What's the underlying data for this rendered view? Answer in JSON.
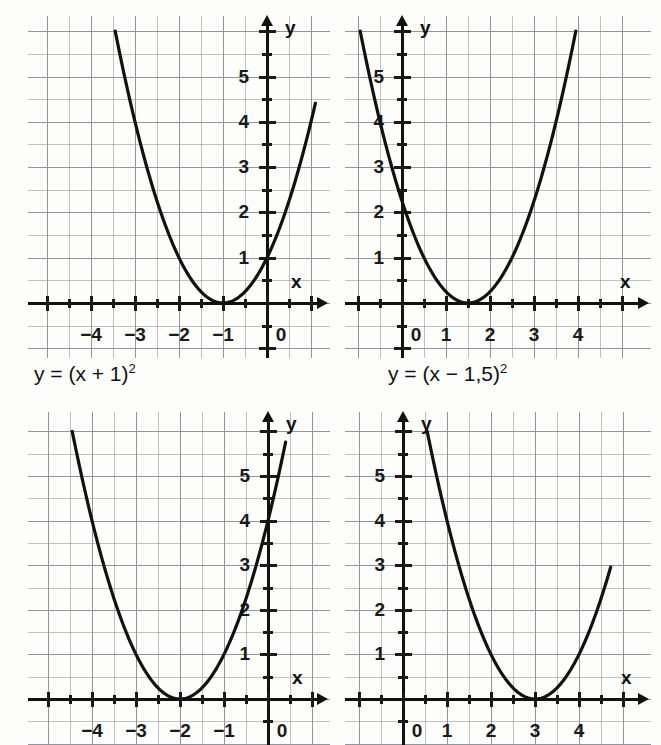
{
  "page": {
    "kind": "worksheet-figure",
    "background": "#fdfdfb",
    "ink": "#111111",
    "grid_color": "#8d8f96",
    "panels": 4
  },
  "chart_data": [
    {
      "id": "panel-1",
      "type": "line",
      "title": "",
      "function_label": "y = (x + 1)²",
      "function_base": "y = (x + 1)",
      "function_exponent": "2",
      "vertex": [
        -1,
        0
      ],
      "formula": "y = (x + 1)^2",
      "xlabel": "x",
      "ylabel": "y",
      "xlim": [
        -5.0,
        0.9
      ],
      "ylim": [
        -0.6,
        6.0
      ],
      "grid": true,
      "grid_step": 0.5,
      "tick_step": 0.5,
      "xticks": [
        -4,
        -3,
        -2,
        -1,
        0
      ],
      "xtick_labels": [
        "−4",
        "−3",
        "−2",
        "−1",
        "0"
      ],
      "yticks": [
        1,
        2,
        3,
        4,
        5
      ],
      "ytick_labels": [
        "1",
        "2",
        "3",
        "4",
        "5"
      ],
      "x": [
        -3.45,
        -3.0,
        -2.5,
        -2.0,
        -1.5,
        -1.0,
        -0.5,
        0.0,
        0.5,
        1.1
      ],
      "y": [
        6.0,
        4.0,
        2.25,
        1.0,
        0.25,
        0.0,
        0.25,
        1.0,
        2.25,
        4.41
      ]
    },
    {
      "id": "panel-2",
      "type": "line",
      "title": "",
      "function_label": "y = (x − 1,5)²",
      "function_base": "y = (x − 1,5)",
      "function_exponent": "2",
      "vertex": [
        1.5,
        0
      ],
      "formula": "y = (x - 1.5)^2",
      "xlabel": "x",
      "ylabel": "y",
      "xlim": [
        -0.75,
        5.1
      ],
      "ylim": [
        -0.6,
        6.0
      ],
      "grid": true,
      "grid_step": 0.5,
      "tick_step": 0.5,
      "xticks": [
        0,
        1,
        2,
        3,
        4
      ],
      "xtick_labels": [
        "0",
        "1",
        "2",
        "3",
        "4"
      ],
      "yticks": [
        1,
        2,
        3,
        4,
        5
      ],
      "ytick_labels": [
        "1",
        "2",
        "3",
        "4",
        "5"
      ],
      "x": [
        -0.95,
        -0.5,
        0.0,
        0.5,
        1.0,
        1.5,
        2.0,
        2.5,
        3.0,
        3.5,
        3.95
      ],
      "y": [
        6.0,
        4.0,
        2.25,
        1.0,
        0.25,
        0.0,
        0.25,
        1.0,
        2.25,
        4.0,
        6.0
      ]
    },
    {
      "id": "panel-3",
      "type": "line",
      "title": "",
      "function_label": "",
      "function_base": "",
      "function_exponent": "",
      "vertex": [
        -2,
        0
      ],
      "formula": "y = (x + 2)^2",
      "xlabel": "x",
      "ylabel": "y",
      "xlim": [
        -5.0,
        0.9
      ],
      "ylim": [
        -0.6,
        6.2
      ],
      "grid": true,
      "grid_step": 0.5,
      "tick_step": 0.5,
      "xticks": [
        -4,
        -3,
        -2,
        -1,
        0
      ],
      "xtick_labels": [
        "−4",
        "−3",
        "−2",
        "−1",
        "0"
      ],
      "yticks": [
        1,
        2,
        3,
        4,
        5
      ],
      "ytick_labels": [
        "1",
        "2",
        "3",
        "4",
        "5"
      ],
      "x": [
        -4.45,
        -4.0,
        -3.5,
        -3.0,
        -2.5,
        -2.0,
        -1.5,
        -1.0,
        -0.5,
        0.0,
        0.4
      ],
      "y": [
        6.0,
        4.0,
        2.25,
        1.0,
        0.25,
        0.0,
        0.25,
        1.0,
        2.25,
        4.0,
        5.76
      ]
    },
    {
      "id": "panel-4",
      "type": "line",
      "title": "",
      "function_label": "",
      "function_base": "",
      "function_exponent": "",
      "vertex": [
        3,
        0
      ],
      "formula": "y = (x - 3)^2",
      "xlabel": "x",
      "ylabel": "y",
      "xlim": [
        -0.75,
        5.1
      ],
      "ylim": [
        -0.6,
        6.2
      ],
      "grid": true,
      "grid_step": 0.5,
      "tick_step": 0.5,
      "xticks": [
        0,
        1,
        2,
        3,
        4
      ],
      "xtick_labels": [
        "0",
        "1",
        "2",
        "3",
        "4"
      ],
      "yticks": [
        1,
        2,
        3,
        4,
        5
      ],
      "ytick_labels": [
        "1",
        "2",
        "3",
        "4",
        "5"
      ],
      "x": [
        0.55,
        1.0,
        1.5,
        2.0,
        2.5,
        3.0,
        3.5,
        4.0,
        4.5,
        4.72
      ],
      "y": [
        6.0,
        4.0,
        2.25,
        1.0,
        0.25,
        0.0,
        0.25,
        1.0,
        2.25,
        2.96
      ]
    }
  ]
}
